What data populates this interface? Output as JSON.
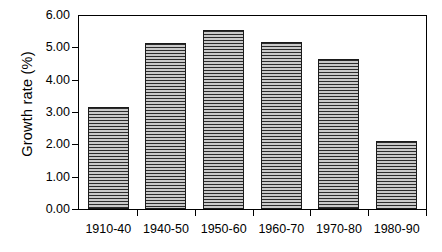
{
  "chart_data": {
    "type": "bar",
    "title": "",
    "xlabel": "",
    "ylabel": "Growth rate (%)",
    "categories": [
      "1910-40",
      "1940-50",
      "1950-60",
      "1960-70",
      "1970-80",
      "1980-90"
    ],
    "values": [
      3.17,
      5.13,
      5.55,
      5.17,
      4.63,
      2.1
    ],
    "series": [
      {
        "name": "Growth rate",
        "values": [
          3.17,
          5.13,
          5.55,
          5.17,
          4.63,
          2.1
        ]
      }
    ],
    "ylim": [
      0.0,
      6.0
    ],
    "ytick_labels": [
      "0.00",
      "1.00",
      "2.00",
      "3.00",
      "4.00",
      "5.00",
      "6.00"
    ],
    "ytick_values": [
      0,
      1,
      2,
      3,
      4,
      5,
      6
    ],
    "grid": false,
    "legend": false,
    "legend_position": "none",
    "bar_fill": "#8c8c8c",
    "bar_pattern": "horizontal-lines",
    "bar_border_color": "#1a1a1a",
    "axis_color": "#000000",
    "background": "#ffffff"
  }
}
